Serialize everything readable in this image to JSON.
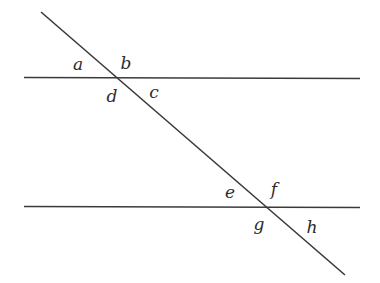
{
  "diagram": {
    "lines": {
      "top_parallel": {
        "x1": 24,
        "y1": 77,
        "x2": 360,
        "y2": 78
      },
      "bottom_parallel": {
        "x1": 24,
        "y1": 206,
        "x2": 360,
        "y2": 207
      },
      "transversal": {
        "x1": 41,
        "y1": 12,
        "x2": 345,
        "y2": 275
      }
    },
    "angle_labels": {
      "a": "a",
      "b": "b",
      "c": "c",
      "d": "d",
      "e": "e",
      "f": "f",
      "g": "g",
      "h": "h"
    },
    "colors": {
      "line": "#3a3a3a",
      "text": "#2b2b2b",
      "background": "#ffffff"
    }
  }
}
